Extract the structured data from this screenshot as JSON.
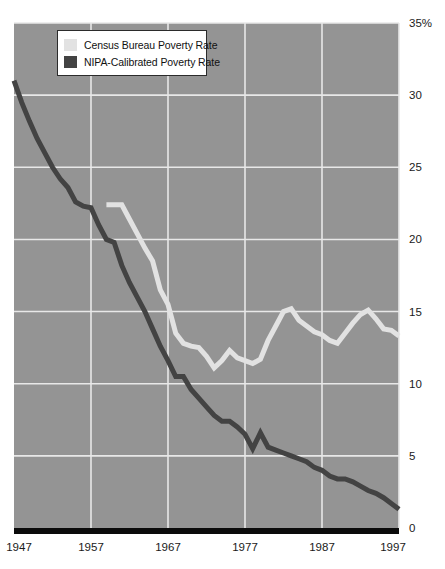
{
  "chart_data": {
    "type": "line",
    "title": "",
    "xlabel": "",
    "ylabel": "",
    "xlim": [
      1947,
      1997
    ],
    "ylim": [
      0,
      35
    ],
    "ytick_labels": [
      "35%",
      "30",
      "25",
      "20",
      "15",
      "10",
      "5",
      "0"
    ],
    "ytick_values": [
      35,
      30,
      25,
      20,
      15,
      10,
      5,
      0
    ],
    "xtick_labels": [
      "1947",
      "1957",
      "1967",
      "1977",
      "1987",
      "1997"
    ],
    "xtick_values": [
      1947,
      1957,
      1967,
      1977,
      1987,
      1997
    ],
    "grid": true,
    "grid_color": "#e8e8e8",
    "plot_background": "#949494",
    "legend_position": "top-left",
    "series": [
      {
        "name": "Census Bureau Poverty Rate",
        "color": "#e2e2e2",
        "x": [
          1959,
          1960,
          1961,
          1962,
          1963,
          1964,
          1965,
          1966,
          1967,
          1968,
          1969,
          1970,
          1971,
          1972,
          1973,
          1974,
          1975,
          1976,
          1977,
          1978,
          1979,
          1980,
          1981,
          1982,
          1983,
          1984,
          1985,
          1986,
          1987,
          1988,
          1989,
          1990,
          1991,
          1992,
          1993,
          1994,
          1995,
          1996,
          1997
        ],
        "values": [
          22.4,
          22.4,
          22.4,
          21.4,
          20.4,
          19.4,
          18.5,
          16.5,
          15.5,
          13.5,
          12.8,
          12.6,
          12.5,
          11.9,
          11.1,
          11.6,
          12.3,
          11.8,
          11.6,
          11.4,
          11.7,
          13.0,
          14.0,
          15.0,
          15.2,
          14.4,
          14.0,
          13.6,
          13.4,
          13.0,
          12.8,
          13.5,
          14.2,
          14.8,
          15.1,
          14.5,
          13.8,
          13.7,
          13.3
        ]
      },
      {
        "name": "NIPA-Calibrated Poverty Rate",
        "color": "#434343",
        "x": [
          1947,
          1948,
          1949,
          1950,
          1951,
          1952,
          1953,
          1954,
          1955,
          1956,
          1957,
          1958,
          1959,
          1960,
          1961,
          1962,
          1963,
          1964,
          1965,
          1966,
          1967,
          1968,
          1969,
          1970,
          1971,
          1972,
          1973,
          1974,
          1975,
          1976,
          1977,
          1978,
          1979,
          1980,
          1981,
          1982,
          1983,
          1984,
          1985,
          1986,
          1987,
          1988,
          1989,
          1990,
          1991,
          1992,
          1993,
          1994,
          1995,
          1996,
          1997
        ],
        "values": [
          31.0,
          29.5,
          28.2,
          27.0,
          26.0,
          25.0,
          24.2,
          23.6,
          22.6,
          22.3,
          22.2,
          21.0,
          20.0,
          19.8,
          18.2,
          17.0,
          16.0,
          15.0,
          13.8,
          12.6,
          11.6,
          10.5,
          10.5,
          9.6,
          9.0,
          8.4,
          7.8,
          7.4,
          7.4,
          7.0,
          6.5,
          5.5,
          6.6,
          5.6,
          5.4,
          5.2,
          5.0,
          4.8,
          4.6,
          4.2,
          4.0,
          3.6,
          3.4,
          3.4,
          3.2,
          2.9,
          2.6,
          2.4,
          2.1,
          1.7,
          1.3
        ]
      }
    ]
  },
  "legend": {
    "items": [
      {
        "label": "Census Bureau Poverty Rate",
        "color": "#e2e2e2"
      },
      {
        "label": "NIPA-Calibrated Poverty Rate",
        "color": "#434343"
      }
    ]
  }
}
